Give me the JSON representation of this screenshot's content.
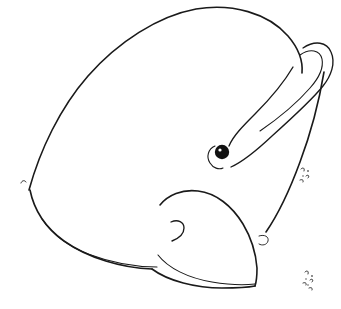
{
  "image": {
    "title": "Line drawing of a whale head",
    "subject": "whale head in profile",
    "style": "black ink contour line drawing on white background",
    "width": 341,
    "height": 309,
    "background_color": "#ffffff",
    "ink_color": "#1a1a1a"
  },
  "parts": [
    {
      "id": "head-dome",
      "label": "Head dome outline"
    },
    {
      "id": "left-jaw-line",
      "label": "Lower left jaw contour"
    },
    {
      "id": "jaw-inner-line",
      "label": "Lower jaw inner parallel line"
    },
    {
      "id": "jaw-tick",
      "label": "Small tick mark at jaw corner"
    },
    {
      "id": "eye",
      "label": "Eye"
    },
    {
      "id": "eye-crescent",
      "label": "Crescent arc beside eye"
    },
    {
      "id": "blowhole-crease",
      "label": "Crease line from fin to eye"
    },
    {
      "id": "flipper-hook",
      "label": "Hooked flipper or ear loop"
    },
    {
      "id": "flipper-inner",
      "label": "Inner line of flipper hook"
    },
    {
      "id": "body-right-line",
      "label": "Right body contour line"
    },
    {
      "id": "mouth-flap",
      "label": "Mouth flap or lower lip shape"
    },
    {
      "id": "mouth-curl",
      "label": "Small hook curl inside mouth"
    },
    {
      "id": "chin-line",
      "label": "Chin underline"
    },
    {
      "id": "speckles-right",
      "label": "Small speckle marks at right"
    },
    {
      "id": "speckles-bottom",
      "label": "Small speckle marks at bottom right"
    }
  ]
}
